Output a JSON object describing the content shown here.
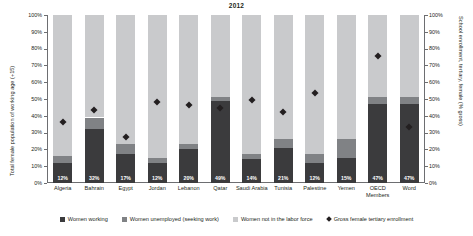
{
  "chart_data": {
    "type": "bar",
    "title": "2012",
    "xlabel": "",
    "ylabel": "Total female population of working age (+15)",
    "ylabel_right": "School enrollment, tertiary, female (% gross)",
    "ylim": [
      0,
      100
    ],
    "ylim_right": [
      0,
      100
    ],
    "grid": false,
    "legend_position": "bottom",
    "stacked": true,
    "tick_labels": [
      "0%",
      "10%",
      "20%",
      "30%",
      "40%",
      "50%",
      "60%",
      "70%",
      "80%",
      "90%",
      "100%"
    ],
    "tick_values": [
      0,
      10,
      20,
      30,
      40,
      50,
      60,
      70,
      80,
      90,
      100
    ],
    "categories": [
      "Algeria",
      "Bahrain",
      "Egypt",
      "Jordan",
      "Lebanon",
      "Qatar",
      "Saudi Arabia",
      "Tunisia",
      "Palestine",
      "Yemen",
      "OECD Members",
      "Word"
    ],
    "series": [
      {
        "name": "Women working",
        "color": "#3b3b3d",
        "values": [
          12,
          32,
          17,
          12,
          20,
          49,
          14,
          21,
          12,
          15,
          47,
          47
        ],
        "labels": [
          "12%",
          "32%",
          "17%",
          "12%",
          "20%",
          "49%",
          "14%",
          "21%",
          "12%",
          "15%",
          "47%",
          "47%"
        ]
      },
      {
        "name": "Women unemployed (seeking work)",
        "color": "#808285",
        "values": [
          4,
          7,
          6,
          3,
          3,
          2,
          3,
          5,
          5,
          11,
          4,
          4
        ],
        "labels": [
          "",
          "",
          "",
          "",
          "",
          "",
          "",
          "",
          "",
          "",
          "",
          ""
        ]
      },
      {
        "name": "Women not in the labor force",
        "color": "#c9cacc",
        "values": [
          84,
          61,
          77,
          85,
          77,
          49,
          83,
          74,
          83,
          74,
          49,
          49
        ],
        "labels": [
          "",
          "",
          "",
          "",
          "",
          "",
          "",
          "",
          "",
          "",
          "",
          ""
        ]
      }
    ],
    "marker_series": {
      "name": "Gross female tertiary enrollment",
      "color": "#231f20",
      "marker": "diamond",
      "axis": "right",
      "values": [
        38,
        45,
        29,
        50,
        48,
        46,
        51,
        44,
        55,
        null,
        77,
        35
      ]
    }
  },
  "legend": [
    {
      "label": "Women working",
      "swatch": "square",
      "color": "#3b3b3d"
    },
    {
      "label": "Women unemployed (seeking work)",
      "swatch": "square",
      "color": "#808285"
    },
    {
      "label": "Women not in the labor force",
      "swatch": "square",
      "color": "#c9cacc"
    },
    {
      "label": "Gross female tertiary enrollment",
      "swatch": "diamond",
      "color": "#231f20"
    }
  ]
}
